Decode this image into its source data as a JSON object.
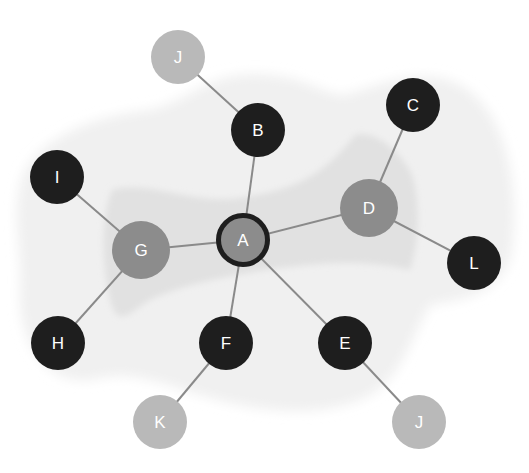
{
  "diagram": {
    "type": "network-graph",
    "colors": {
      "background": "#ffffff",
      "outer_region": "#f0f0f0",
      "inner_region": "#e0e0e0",
      "edge": "#8a8a8a",
      "dark_node": "#1e1e1e",
      "mid_node": "#8c8c8c",
      "light_node": "#b9b9b9",
      "center_border": "#1e1e1e",
      "label": "#ffffff"
    },
    "nodes": [
      {
        "id": "A",
        "label": "A",
        "x": 243,
        "y": 240,
        "r": 27,
        "style": "center"
      },
      {
        "id": "B",
        "label": "B",
        "x": 258,
        "y": 130,
        "r": 27,
        "style": "dark"
      },
      {
        "id": "C",
        "label": "C",
        "x": 413,
        "y": 105,
        "r": 27,
        "style": "dark"
      },
      {
        "id": "D",
        "label": "D",
        "x": 369,
        "y": 208,
        "r": 29,
        "style": "mid"
      },
      {
        "id": "E",
        "label": "E",
        "x": 345,
        "y": 343,
        "r": 27,
        "style": "dark"
      },
      {
        "id": "F",
        "label": "F",
        "x": 226,
        "y": 343,
        "r": 27,
        "style": "dark"
      },
      {
        "id": "G",
        "label": "G",
        "x": 141,
        "y": 250,
        "r": 29,
        "style": "mid"
      },
      {
        "id": "H",
        "label": "H",
        "x": 58,
        "y": 343,
        "r": 27,
        "style": "dark"
      },
      {
        "id": "I",
        "label": "I",
        "x": 57,
        "y": 177,
        "r": 27,
        "style": "dark"
      },
      {
        "id": "J1",
        "label": "J",
        "x": 178,
        "y": 57,
        "r": 27,
        "style": "light"
      },
      {
        "id": "J2",
        "label": "J",
        "x": 419,
        "y": 422,
        "r": 27,
        "style": "light"
      },
      {
        "id": "K",
        "label": "K",
        "x": 160,
        "y": 422,
        "r": 27,
        "style": "light"
      },
      {
        "id": "L",
        "label": "L",
        "x": 474,
        "y": 263,
        "r": 27,
        "style": "dark"
      }
    ],
    "edges": [
      {
        "from": "A",
        "to": "B"
      },
      {
        "from": "A",
        "to": "D"
      },
      {
        "from": "A",
        "to": "G"
      },
      {
        "from": "A",
        "to": "F"
      },
      {
        "from": "A",
        "to": "E"
      },
      {
        "from": "B",
        "to": "J1"
      },
      {
        "from": "D",
        "to": "C"
      },
      {
        "from": "D",
        "to": "L"
      },
      {
        "from": "G",
        "to": "I"
      },
      {
        "from": "G",
        "to": "H"
      },
      {
        "from": "F",
        "to": "K"
      },
      {
        "from": "E",
        "to": "J2"
      }
    ]
  }
}
